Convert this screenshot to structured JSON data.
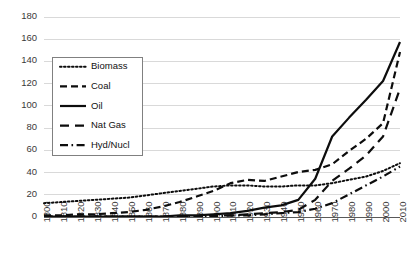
{
  "chart_data": {
    "type": "line",
    "title": "",
    "xlabel": "",
    "ylabel": "",
    "xlim": [
      1800,
      2010
    ],
    "ylim": [
      0,
      180
    ],
    "ytick_step": 20,
    "xtick_step": 10,
    "grid": "horizontal",
    "legend_position": "upper-left-inside",
    "yticks": [
      "0",
      "20",
      "40",
      "60",
      "80",
      "100",
      "120",
      "140",
      "160",
      "180"
    ],
    "x": [
      1800,
      1810,
      1820,
      1830,
      1840,
      1850,
      1860,
      1870,
      1880,
      1890,
      1900,
      1910,
      1920,
      1930,
      1940,
      1950,
      1960,
      1970,
      1980,
      1990,
      2000,
      2010
    ],
    "xticks": [
      "1800",
      "1810",
      "1820",
      "1830",
      "1840",
      "1850",
      "1860",
      "1870",
      "1880",
      "1890",
      "1900",
      "1910",
      "1920",
      "1930",
      "1940",
      "1950",
      "1960",
      "1970",
      "1980",
      "1990",
      "2000",
      "2010"
    ],
    "series": [
      {
        "name": "Biomass",
        "style": "dotted",
        "dash": "1.6 2.4",
        "width": 2.0,
        "values": [
          12,
          13,
          14,
          15,
          16,
          17,
          19,
          21,
          23,
          25,
          27,
          28,
          28,
          27,
          27,
          28,
          28,
          30,
          33,
          36,
          41,
          48
        ]
      },
      {
        "name": "Coal",
        "style": "dashed",
        "dash": "7 4",
        "width": 2.2,
        "values": [
          1,
          1,
          2,
          2,
          3,
          4,
          6,
          9,
          13,
          18,
          23,
          30,
          33,
          32,
          36,
          40,
          42,
          47,
          59,
          70,
          84,
          148
        ]
      },
      {
        "name": "Oil",
        "style": "solid",
        "dash": "none",
        "width": 2.2,
        "values": [
          0,
          0,
          0,
          0,
          0,
          0,
          0,
          0,
          1,
          1,
          2,
          3,
          5,
          8,
          10,
          15,
          34,
          72,
          89,
          105,
          122,
          157
        ]
      },
      {
        "name": "Nat Gas",
        "style": "long-dash",
        "dash": "9 6",
        "width": 2.2,
        "values": [
          0,
          0,
          0,
          0,
          0,
          0,
          0,
          0,
          0,
          0,
          1,
          1,
          2,
          3,
          4,
          6,
          15,
          32,
          43,
          55,
          72,
          115
        ]
      },
      {
        "name": "Hyd/Nucl",
        "style": "dash-dot",
        "dash": "8 3.5 1.6 3.5",
        "width": 2.2,
        "values": [
          0,
          0,
          0,
          0,
          0,
          0,
          0,
          0,
          0,
          0,
          0,
          1,
          1,
          2,
          3,
          4,
          7,
          12,
          20,
          28,
          36,
          45
        ]
      }
    ]
  },
  "legend": {
    "entries": [
      {
        "label": "Biomass"
      },
      {
        "label": "Coal"
      },
      {
        "label": "Oil"
      },
      {
        "label": "Nat Gas"
      },
      {
        "label": "Hyd/Nucl"
      }
    ]
  },
  "colors": {
    "series": "#0d0d0d",
    "grid": "#d9d9d9",
    "axis": "#595959",
    "tick_text": "#3a3a3a",
    "legend_border": "#808080",
    "background": "#ffffff"
  }
}
